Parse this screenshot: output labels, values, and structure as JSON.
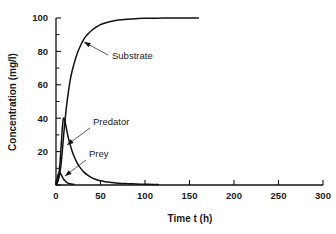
{
  "chart_data": {
    "type": "line",
    "title": "",
    "xlabel": "Time t (h)",
    "ylabel": "Concentration (mg/l)",
    "xlim": [
      0,
      300
    ],
    "ylim": [
      0,
      100
    ],
    "xticks": [
      0,
      50,
      100,
      150,
      200,
      250,
      300
    ],
    "xticklabels": [
      "0",
      "50",
      "100",
      "150",
      "200",
      "250",
      "300"
    ],
    "yticks": [
      0,
      20,
      40,
      60,
      80,
      100
    ],
    "yticklabels": [
      "0",
      "20",
      "40",
      "60",
      "80",
      "100"
    ],
    "grid": false,
    "legend": "inline-annotations",
    "series": [
      {
        "name": "Substrate",
        "color": "#111111",
        "x": [
          0,
          2,
          4,
          6,
          8,
          10,
          12,
          14,
          16,
          18,
          20,
          24,
          28,
          32,
          36,
          40,
          45,
          50,
          55,
          60,
          70,
          80,
          90,
          100,
          120,
          140,
          160
        ],
        "y": [
          0,
          2,
          6,
          14,
          26,
          38,
          48,
          56,
          63,
          68,
          72,
          79,
          84,
          88,
          90.5,
          92.5,
          94.5,
          96,
          97,
          97.8,
          98.8,
          99.3,
          99.6,
          99.8,
          99.95,
          100,
          100
        ]
      },
      {
        "name": "Predator",
        "color": "#111111",
        "x": [
          0,
          2,
          4,
          6,
          7,
          8,
          9,
          10,
          12,
          14,
          16,
          18,
          20,
          24,
          28,
          32,
          36,
          40,
          45,
          50,
          55,
          60,
          70,
          80,
          90,
          100,
          110,
          115
        ],
        "y": [
          0.5,
          3,
          10,
          25,
          33,
          39,
          40,
          38.5,
          33,
          28,
          24,
          20.5,
          17.5,
          13,
          9.8,
          7.4,
          5.7,
          4.4,
          3.3,
          2.5,
          2.0,
          1.6,
          1.1,
          0.8,
          0.6,
          0.45,
          0.35,
          0.3
        ]
      },
      {
        "name": "Prey",
        "color": "#111111",
        "x": [
          0,
          1,
          2,
          3,
          4,
          5,
          6,
          7,
          8,
          9,
          10,
          12,
          14,
          16,
          18,
          20
        ],
        "y": [
          1,
          3,
          5.5,
          7,
          7.5,
          7,
          6,
          5,
          4,
          3.2,
          2.5,
          1.6,
          1.0,
          0.7,
          0.5,
          0.4
        ]
      }
    ],
    "annotations": [
      {
        "text": "Substrate",
        "label_x": 112,
        "label_y": 59,
        "leader_from_x": 108,
        "leader_from_y": 55,
        "leader_to_x": 84,
        "leader_to_y": 42
      },
      {
        "text": "Predator",
        "label_x": 93,
        "label_y": 125,
        "leader_from_x": 90,
        "leader_from_y": 128,
        "leader_to_x": 67,
        "leader_to_y": 145
      },
      {
        "text": "Prey",
        "label_x": 89,
        "label_y": 157,
        "leader_from_x": 86,
        "leader_from_y": 160,
        "leader_to_x": 65,
        "leader_to_y": 176
      }
    ]
  },
  "axes": {
    "y_title": "Concentration (mg/l)",
    "x_title": "Time t (h)"
  }
}
